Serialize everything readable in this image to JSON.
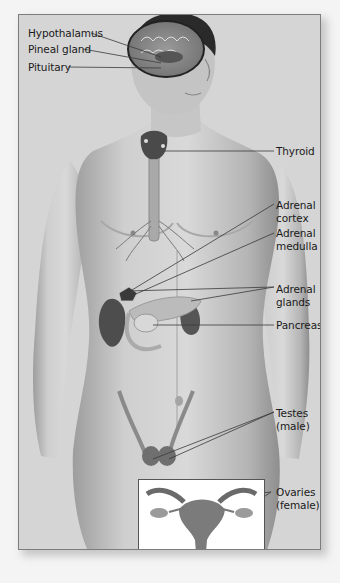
{
  "figure": {
    "labels": {
      "hypothalamus": "Hypothalamus",
      "pineal_gland": "Pineal gland",
      "pituitary": "Pituitary",
      "thyroid": "Thyroid",
      "adrenal_cortex_1": "Adrenal",
      "adrenal_cortex_2": "cortex",
      "adrenal_medulla_1": "Adrenal",
      "adrenal_medulla_2": "medulla",
      "adrenal_glands_1": "Adrenal",
      "adrenal_glands_2": "glands",
      "pancreas": "Pancreas",
      "testes_1": "Testes",
      "testes_2": "(male)",
      "ovaries_1": "Ovaries",
      "ovaries_2": "(female)"
    },
    "inset": {
      "subject": "Female reproductive organs (uterus and ovaries)"
    },
    "colors": {
      "background": "#d5d5d5",
      "frame_border": "#7d7d7d",
      "skin": "#bdbdbd",
      "organ_dark": "#4a4a4a",
      "leader_line": "#3a3a3a",
      "inset_bg": "#ffffff"
    }
  }
}
